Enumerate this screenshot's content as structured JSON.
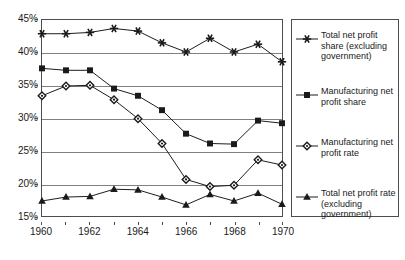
{
  "chart_data": {
    "type": "line",
    "title": "",
    "xlabel": "",
    "ylabel": "",
    "x": [
      1960,
      1961,
      1962,
      1963,
      1964,
      1965,
      1966,
      1967,
      1968,
      1969,
      1970
    ],
    "xlim": [
      1960,
      1970
    ],
    "ylim": [
      15,
      45
    ],
    "ytick_values": [
      15,
      20,
      25,
      30,
      35,
      40,
      45
    ],
    "ytick_labels": [
      "15%",
      "20%",
      "25%",
      "30%",
      "35%",
      "40%",
      "45%"
    ],
    "xtick_values": [
      1960,
      1962,
      1964,
      1966,
      1968,
      1970
    ],
    "xtick_labels": [
      "1960",
      "1962",
      "1964",
      "1966",
      "1968",
      "1970"
    ],
    "grid": "horizontal",
    "legend_position": "right-outside",
    "series": [
      {
        "name": "Total net profit share (excluding government)",
        "marker": "star-icon",
        "color": "#1a1a1a",
        "values": [
          42.9,
          42.9,
          43.1,
          43.7,
          43.3,
          41.5,
          40.1,
          42.2,
          40.1,
          41.3,
          38.6
        ]
      },
      {
        "name": "Manufacturing net profit share",
        "marker": "square-icon",
        "color": "#1a1a1a",
        "values": [
          37.6,
          37.3,
          37.3,
          34.5,
          33.4,
          31.2,
          27.6,
          26.1,
          26.0,
          29.6,
          29.2
        ]
      },
      {
        "name": "Manufacturing net profit rate",
        "marker": "diamond-icon",
        "color": "#1a1a1a",
        "values": [
          33.4,
          34.9,
          35.0,
          32.8,
          29.9,
          26.1,
          20.6,
          19.5,
          19.7,
          23.6,
          22.8
        ]
      },
      {
        "name": "Total net profit rate (excluding government)",
        "marker": "triangle-icon",
        "color": "#1a1a1a",
        "values": [
          17.3,
          17.9,
          18.0,
          19.1,
          19.0,
          17.9,
          16.7,
          18.3,
          17.3,
          18.5,
          16.8
        ]
      }
    ]
  },
  "legend": {
    "entries": [
      {
        "label": "Total net profit share (excluding government)",
        "marker": "star-icon"
      },
      {
        "label": "Manufacturing net profit share",
        "marker": "square-icon"
      },
      {
        "label": "Manufacturing net profit rate",
        "marker": "diamond-icon"
      },
      {
        "label": "Total net profit rate (excluding government)",
        "marker": "triangle-icon"
      }
    ]
  }
}
